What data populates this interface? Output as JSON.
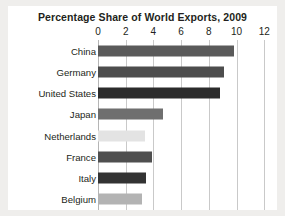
{
  "chart_data": {
    "type": "bar",
    "orientation": "horizontal",
    "title": "Percentage Share of World Exports, 2009",
    "xlabel": "",
    "ylabel": "",
    "xlim": [
      0,
      12
    ],
    "xticks": [
      0,
      2,
      4,
      6,
      8,
      10,
      12
    ],
    "xtick_labels": [
      "0",
      "2",
      "4",
      "6",
      "8",
      "10",
      "12"
    ],
    "grid": true,
    "legend": false,
    "categories": [
      "China",
      "Germany",
      "United States",
      "Japan",
      "Netherlands",
      "France",
      "Italy",
      "Belgium"
    ],
    "values": [
      9.8,
      9.1,
      8.8,
      4.7,
      3.4,
      3.9,
      3.5,
      3.2
    ],
    "bar_colors": [
      "#5a5a5a",
      "#4d4d4d",
      "#2b2b2b",
      "#6f6f6f",
      "#e3e3e3",
      "#4f4f4f",
      "#333333",
      "#b3b3b3"
    ]
  },
  "style": {
    "page_background": "#efeeec",
    "card_background": "#ffffff",
    "text_color": "#231f20",
    "gridline_color": "#c9c9c9"
  }
}
